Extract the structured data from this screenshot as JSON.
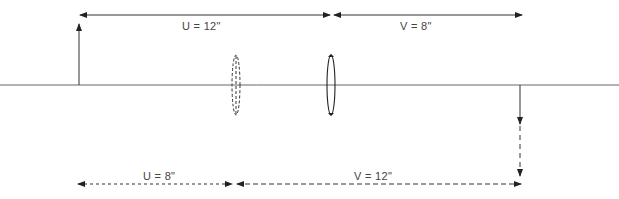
{
  "diagram": {
    "top": {
      "u_label": "U = 12\"",
      "v_label": "V = 8\""
    },
    "bottom": {
      "u_label": "U = 8\"",
      "v_label": "V = 12\""
    },
    "elements": {
      "object": "upright object arrow",
      "lens_solid": "converging lens (position 1)",
      "lens_dashed": "converging lens (position 2)",
      "image": "inverted image arrow"
    },
    "colors": {
      "line": "#222222",
      "axis": "#555555"
    }
  }
}
